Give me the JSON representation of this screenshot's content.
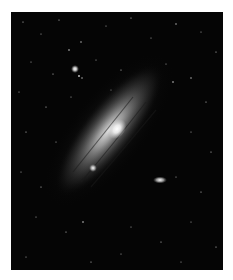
{
  "image": {
    "subject": "Andromeda galaxy (spiral galaxy) with satellite galaxies in a star field",
    "style": "grayscale astrophotograph",
    "frame_color": "#ffffff",
    "background_color": "#050505",
    "features": [
      {
        "name": "galaxy-disk",
        "description": "elongated diagonal spiral disk running from upper-right to lower-left"
      },
      {
        "name": "galaxy-core",
        "description": "bright central nucleus"
      },
      {
        "name": "companion-galaxy-small",
        "description": "compact bright satellite to the lower-left of the core"
      },
      {
        "name": "companion-galaxy-elliptical",
        "description": "small elongated satellite to the right of the core"
      },
      {
        "name": "bright-foreground-star",
        "description": "bright star in the upper-left"
      }
    ]
  }
}
